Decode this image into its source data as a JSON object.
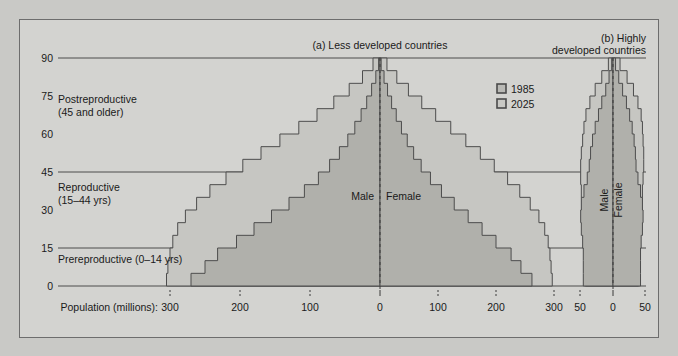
{
  "figure": {
    "background_color": "#d3d3d0",
    "outer_color": "#c9c9c6",
    "border_color": "#6d6d6d"
  },
  "legend": {
    "items": [
      {
        "label": "1985",
        "fill": "#b9b9b5",
        "stroke": "#4a4a4a"
      },
      {
        "label": "2025",
        "fill": "#c9c9c5",
        "stroke": "#4a4a4a"
      }
    ]
  },
  "axis": {
    "y_label_values": [
      "0",
      "15",
      "30",
      "45",
      "60",
      "75",
      "90"
    ],
    "x_axis_title": "Population (millions):",
    "panel_a_ticks": [
      "300",
      "200",
      "100",
      "0",
      "100",
      "200",
      "300"
    ],
    "panel_b_ticks": [
      "50",
      "0",
      "50"
    ],
    "gridlines_at": [
      0,
      15,
      45,
      90
    ]
  },
  "categories": [
    {
      "name": "Postreproductive",
      "range": "(45 and older)"
    },
    {
      "name": "Reproductive",
      "range": "(15–44 yrs)"
    },
    {
      "name": "Prereproductive (0–14 yrs)",
      "range": ""
    }
  ],
  "panels": [
    {
      "id": "a",
      "title": "(a) Less developed countries",
      "male_label": "Male",
      "female_label": "Female"
    },
    {
      "id": "b",
      "title_line1": "(b) Highly",
      "title_line2": "developed countries",
      "male_label": "Male",
      "female_label": "Female"
    }
  ],
  "chart_data": {
    "type": "bar",
    "subtype": "population-pyramid",
    "xlabel": "Population (millions)",
    "ylabel": "Age (years)",
    "ylim": [
      0,
      90
    ],
    "age_bins": [
      [
        0,
        5
      ],
      [
        5,
        10
      ],
      [
        10,
        15
      ],
      [
        15,
        20
      ],
      [
        20,
        25
      ],
      [
        25,
        30
      ],
      [
        30,
        35
      ],
      [
        35,
        40
      ],
      [
        40,
        45
      ],
      [
        45,
        50
      ],
      [
        50,
        55
      ],
      [
        55,
        60
      ],
      [
        60,
        65
      ],
      [
        65,
        70
      ],
      [
        70,
        75
      ],
      [
        75,
        80
      ],
      [
        80,
        85
      ],
      [
        85,
        90
      ]
    ],
    "panel_a": {
      "name": "Less developed countries",
      "xlim": [
        0,
        330
      ],
      "xticks": [
        300,
        200,
        100,
        0,
        100,
        200,
        300
      ],
      "series": [
        {
          "name": "1985",
          "side": "male",
          "values": [
            270,
            250,
            232,
            205,
            180,
            155,
            130,
            108,
            88,
            72,
            58,
            46,
            36,
            27,
            19,
            12,
            6,
            2
          ]
        },
        {
          "name": "1985",
          "side": "female",
          "values": [
            262,
            243,
            226,
            200,
            176,
            152,
            128,
            106,
            87,
            71,
            58,
            47,
            37,
            28,
            20,
            13,
            7,
            2
          ]
        },
        {
          "name": "2025",
          "side": "male",
          "values": [
            305,
            303,
            300,
            296,
            289,
            278,
            262,
            243,
            220,
            196,
            170,
            143,
            116,
            90,
            66,
            44,
            25,
            10
          ]
        },
        {
          "name": "2025",
          "side": "female",
          "values": [
            297,
            295,
            293,
            290,
            284,
            274,
            259,
            241,
            220,
            197,
            173,
            148,
            122,
            96,
            72,
            49,
            29,
            12
          ]
        }
      ]
    },
    "panel_b": {
      "name": "Highly developed countries",
      "xlim": [
        0,
        58
      ],
      "xticks": [
        50,
        0,
        50
      ],
      "series": [
        {
          "name": "1985",
          "side": "male",
          "values": [
            45,
            45,
            45,
            46,
            48,
            49,
            48,
            44,
            39,
            36,
            34,
            31,
            27,
            22,
            17,
            11,
            6,
            2
          ]
        },
        {
          "name": "1985",
          "side": "female",
          "values": [
            43,
            43,
            43,
            44,
            46,
            47,
            46,
            43,
            39,
            36,
            35,
            33,
            30,
            26,
            21,
            15,
            9,
            4
          ]
        },
        {
          "name": "2025",
          "side": "male",
          "values": [
            42,
            42,
            43,
            44,
            45,
            46,
            47,
            48,
            49,
            49,
            48,
            46,
            44,
            41,
            35,
            27,
            17,
            7
          ]
        },
        {
          "name": "2025",
          "side": "female",
          "values": [
            40,
            40,
            41,
            42,
            43,
            44,
            45,
            46,
            47,
            48,
            48,
            47,
            46,
            44,
            39,
            32,
            22,
            11
          ]
        }
      ]
    }
  }
}
